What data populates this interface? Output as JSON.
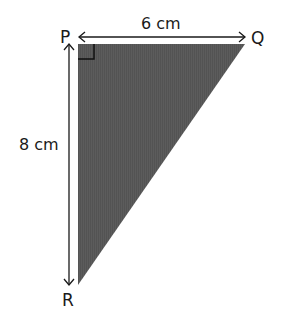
{
  "diagram": {
    "type": "right-triangle",
    "vertices": {
      "P": "P",
      "Q": "Q",
      "R": "R"
    },
    "dimensions": {
      "top": "6 cm",
      "left": "8 cm"
    },
    "right_angle_at": "P",
    "fill_color": "#5a5a5a",
    "line_color": "#1a1a1a"
  }
}
